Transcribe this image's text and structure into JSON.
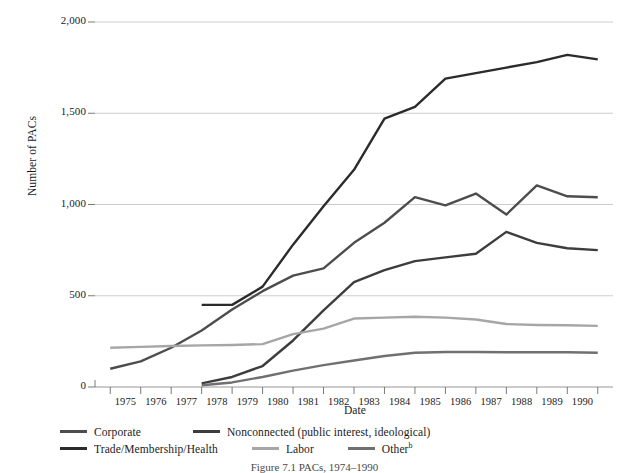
{
  "chart_data": {
    "type": "line",
    "title": "",
    "caption": "Figure 7.1 PACs, 1974–1990",
    "xlabel": "Date",
    "ylabel": "Number of PACs",
    "xlim": [
      1974,
      1991
    ],
    "ylim": [
      0,
      2000
    ],
    "yticks": [
      0,
      500,
      1000,
      1500,
      2000
    ],
    "ytick_labels": [
      "0",
      "500",
      "1,000",
      "1,500",
      "2,000"
    ],
    "xticks": [
      1975,
      1976,
      1977,
      1978,
      1979,
      1980,
      1981,
      1982,
      1983,
      1984,
      1985,
      1986,
      1987,
      1988,
      1989,
      1990
    ],
    "xtick_labels": [
      "1975",
      "1976",
      "1977",
      "1978",
      "1979",
      "1980",
      "1981",
      "1982",
      "1983",
      "1984",
      "1985",
      "1986",
      "1987",
      "1988",
      "1989",
      "1990"
    ],
    "grid": "horizontal",
    "legend_position": "below",
    "series": [
      {
        "name": "Corporate",
        "color": "#4d4d4d",
        "x": [
          1974.5,
          1975.5,
          1976.5,
          1977.5,
          1978.5,
          1979.5,
          1980.5,
          1981.5,
          1982.5,
          1983.5,
          1984.5,
          1985.5,
          1986.5,
          1987.5,
          1988.5,
          1989.5,
          1990.5
        ],
        "values": [
          100,
          140,
          215,
          310,
          425,
          525,
          610,
          650,
          790,
          900,
          1040,
          995,
          1060,
          945,
          1105,
          1045,
          1040
        ]
      },
      {
        "name": "Nonconnected (public interest, ideological)",
        "color": "#3d3d3d",
        "x": [
          1977.5,
          1978.5,
          1979.5,
          1980.5,
          1981.5,
          1982.5,
          1983.5,
          1984.5,
          1985.5,
          1986.5,
          1987.5,
          1988.5,
          1989.5,
          1990.5
        ],
        "values": [
          20,
          55,
          115,
          255,
          420,
          575,
          640,
          690,
          710,
          730,
          850,
          790,
          760,
          750
        ]
      },
      {
        "name": "Trade/Membership/Health",
        "color": "#2b2b2b",
        "x": [
          1977.5,
          1978.5,
          1979.5,
          1980.5,
          1981.5,
          1982.5,
          1983.5,
          1984.5,
          1985.5,
          1986.5,
          1987.5,
          1988.5,
          1989.5,
          1990.5
        ],
        "values": [
          450,
          450,
          550,
          780,
          990,
          1190,
          1470,
          1535,
          1690,
          1720,
          1750,
          1780,
          1820,
          1795
        ]
      },
      {
        "name": "Labor",
        "color": "#a6a6a6",
        "x": [
          1974.5,
          1975.5,
          1976.5,
          1977.5,
          1978.5,
          1979.5,
          1980.5,
          1981.5,
          1982.5,
          1983.5,
          1984.5,
          1985.5,
          1986.5,
          1987.5,
          1988.5,
          1989.5,
          1990.5
        ],
        "values": [
          215,
          220,
          225,
          228,
          230,
          235,
          290,
          320,
          375,
          380,
          385,
          380,
          370,
          345,
          340,
          338,
          335
        ]
      },
      {
        "name": "Other",
        "color": "#707070",
        "x": [
          1977.5,
          1978.5,
          1979.5,
          1980.5,
          1981.5,
          1982.5,
          1983.5,
          1984.5,
          1985.5,
          1986.5,
          1987.5,
          1988.5,
          1989.5,
          1990.5
        ],
        "values": [
          10,
          25,
          55,
          90,
          120,
          145,
          170,
          188,
          192,
          192,
          190,
          190,
          190,
          188
        ]
      }
    ]
  },
  "axis": {
    "ylabel": "Number of PACs",
    "xlabel": "Date"
  },
  "legend": {
    "rows": [
      [
        {
          "label": "Corporate",
          "color": "#4d4d4d",
          "sup": ""
        },
        {
          "label": "Nonconnected (public interest, ideological)",
          "color": "#3d3d3d",
          "sup": ""
        }
      ],
      [
        {
          "label": "Trade/Membership/Health",
          "color": "#2b2b2b",
          "sup": ""
        },
        {
          "label": "Labor",
          "color": "#a6a6a6",
          "sup": ""
        },
        {
          "label": "Other",
          "color": "#707070",
          "sup": "b"
        }
      ]
    ]
  },
  "caption": {
    "text": "Figure 7.1 PACs, 1974–1990"
  }
}
